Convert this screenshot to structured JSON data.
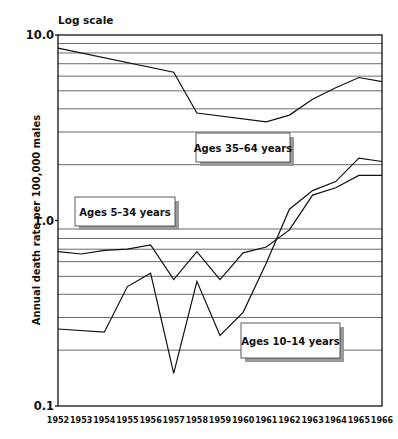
{
  "chart_data": {
    "type": "line",
    "title": "Log scale",
    "xlabel": "",
    "ylabel": "Annual death rate per 100,000 males",
    "yscale": "log",
    "ylim": [
      0.1,
      10.0
    ],
    "y_tick_labels": [
      "10.0",
      "1.0",
      "0.1"
    ],
    "y_ticks": [
      10.0,
      1.0,
      0.1
    ],
    "y_gridlines": [
      9,
      8,
      7,
      6,
      5,
      4,
      3,
      2,
      0.9,
      0.8,
      0.7,
      0.6,
      0.5,
      0.4,
      0.3,
      0.2
    ],
    "grid": true,
    "x": [
      "1952",
      "1953",
      "1954",
      "1955",
      "1956",
      "1957",
      "1958",
      "1959",
      "1960",
      "1961",
      "1962",
      "1963",
      "1964",
      "1965",
      "1966"
    ],
    "series": [
      {
        "name": "Ages 35–64 years",
        "x": [
          "1952",
          "1957",
          "1958",
          "1961",
          "1962",
          "1963",
          "1964",
          "1965",
          "1966"
        ],
        "values": [
          8.5,
          6.3,
          3.8,
          3.4,
          3.7,
          4.5,
          5.2,
          5.9,
          5.6
        ]
      },
      {
        "name": "Ages 5–34 years",
        "x": [
          "1952",
          "1953",
          "1954",
          "1955",
          "1956",
          "1957",
          "1958",
          "1959",
          "1960",
          "1961",
          "1962",
          "1963",
          "1964",
          "1965",
          "1966"
        ],
        "values": [
          0.68,
          0.66,
          0.69,
          0.7,
          0.74,
          0.48,
          0.68,
          0.48,
          0.67,
          0.72,
          0.89,
          1.37,
          1.5,
          1.75,
          1.75
        ]
      },
      {
        "name": "Ages 10–14 years",
        "x": [
          "1952",
          "1954",
          "1955",
          "1956",
          "1957",
          "1958",
          "1959",
          "1960",
          "1961",
          "1962",
          "1963",
          "1964",
          "1965",
          "1966"
        ],
        "values": [
          0.26,
          0.25,
          0.44,
          0.52,
          0.15,
          0.47,
          0.24,
          0.32,
          0.59,
          1.15,
          1.45,
          1.62,
          2.17,
          2.08
        ]
      }
    ],
    "annotations": [
      {
        "text": "Ages 35–64 years",
        "series": "Ages 35–64 years"
      },
      {
        "text": "Ages 5–34 years",
        "series": "Ages 5–34 years"
      },
      {
        "text": "Ages 10–14 years",
        "series": "Ages 10–14 years"
      }
    ],
    "legend": "none (inline boxed labels)"
  }
}
